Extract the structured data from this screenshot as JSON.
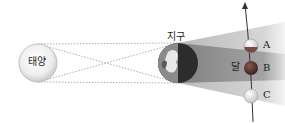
{
  "diagram": {
    "type": "lunar-eclipse",
    "sun": {
      "label": "태양",
      "cx": 38,
      "cy": 63,
      "r": 19
    },
    "earth": {
      "label": "지구",
      "cx": 178,
      "cy": 63,
      "r": 20
    },
    "moon": {
      "label": "달",
      "positions": [
        {
          "id": "A",
          "label": "A",
          "cx": 251,
          "cy": 46,
          "state": "partial"
        },
        {
          "id": "B",
          "label": "B",
          "cx": 251,
          "cy": 68,
          "state": "total"
        },
        {
          "id": "C",
          "label": "C",
          "cx": 251,
          "cy": 96,
          "state": "penumbral"
        }
      ],
      "r": 7
    },
    "colors": {
      "umbra": "#8c8c8c",
      "penumbra": "#c8c8c8",
      "moon_dark": "#6b3a34",
      "orbit": "#333333"
    }
  }
}
